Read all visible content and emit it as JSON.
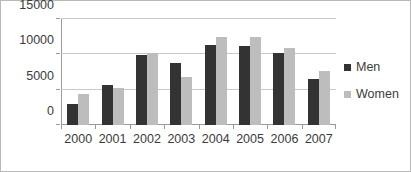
{
  "chart_data": {
    "type": "bar",
    "title": "",
    "xlabel": "",
    "ylabel": "",
    "categories": [
      "2000",
      "2001",
      "2002",
      "2003",
      "2004",
      "2005",
      "2006",
      "2007"
    ],
    "series": [
      {
        "name": "Men",
        "color": "#333333",
        "values": [
          3000,
          5700,
          9900,
          8800,
          11300,
          11200,
          10200,
          6500
        ]
      },
      {
        "name": "Women",
        "color": "#bdbdbd",
        "values": [
          4400,
          5300,
          10200,
          6800,
          12500,
          12400,
          10900,
          7700
        ]
      }
    ],
    "ylim": [
      0,
      15000
    ],
    "yticks": [
      0,
      5000,
      10000,
      15000
    ],
    "ytick_labels": [
      "0",
      "5000",
      "10000",
      "15000"
    ],
    "grid": true,
    "legend_position": "right"
  },
  "legend": {
    "entries": [
      {
        "label": "Men"
      },
      {
        "label": "Women"
      }
    ]
  },
  "colors": {
    "men": "#333333",
    "women": "#bdbdbd",
    "gridline": "#c8c8c8",
    "axis": "#9a9a9a",
    "border": "#b9b9b9",
    "text": "#3b3b3b",
    "background": "#ffffff"
  }
}
